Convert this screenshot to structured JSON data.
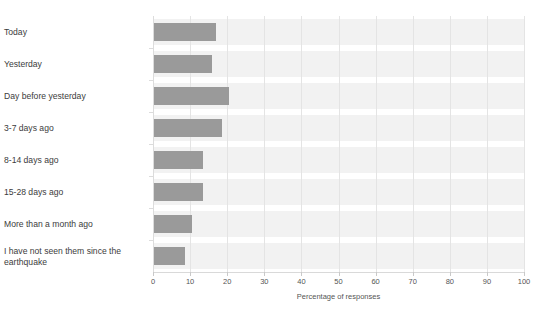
{
  "clipped_title": "",
  "chart_data": {
    "type": "bar",
    "orientation": "horizontal",
    "title": "",
    "xlabel": "Percentage of responses",
    "ylabel": "",
    "xlim": [
      0,
      100
    ],
    "xticks": [
      0,
      10,
      20,
      30,
      40,
      50,
      60,
      70,
      80,
      90,
      100
    ],
    "grid": true,
    "legend": false,
    "bar_color": "#9a9a9a",
    "band_color": "#f2f2f2",
    "categories": [
      "Today",
      "Yesterday",
      "Day before yesterday",
      "3-7 days ago",
      "8-14 days ago",
      "15-28 days ago",
      "More than a month ago",
      "I have not seen them since the earthquake"
    ],
    "values": [
      17,
      16,
      20.5,
      18.5,
      13.5,
      13.5,
      10.5,
      8.5
    ]
  }
}
